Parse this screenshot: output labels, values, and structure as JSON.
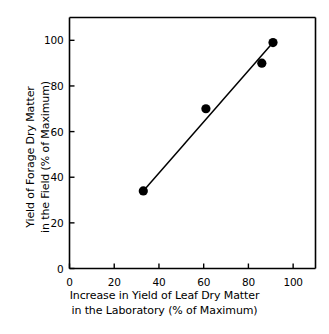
{
  "chart_data": {
    "type": "scatter",
    "title": "",
    "xlabel": "Increase in Yield of Leaf Dry Matter in the Laboratory (% of Maximum)",
    "ylabel": "Yield of Forage Dry Matter in the Field (% of Maximum)",
    "xlabel_line1": "Increase in Yield of Leaf Dry Matter",
    "xlabel_line2": "in the Laboratory (% of Maximum)",
    "ylabel_line1": "Yield of Forage Dry Matter",
    "ylabel_line2": "in the Field (% of Maximum)",
    "xlim": [
      0,
      110
    ],
    "ylim": [
      0,
      110
    ],
    "xticks": [
      0,
      20,
      40,
      60,
      80,
      100
    ],
    "yticks": [
      0,
      20,
      40,
      60,
      80,
      100
    ],
    "xtick_labels": [
      "0",
      "20",
      "40",
      "60",
      "80",
      "100"
    ],
    "ytick_labels": [
      "0",
      "20",
      "40",
      "60",
      "80",
      "100"
    ],
    "grid": false,
    "legend": false,
    "marker": "filled-circle",
    "marker_color": "#000000",
    "line_color": "#000000",
    "points": [
      {
        "x": 33,
        "y": 34
      },
      {
        "x": 61,
        "y": 70
      },
      {
        "x": 86,
        "y": 90
      },
      {
        "x": 91,
        "y": 99
      }
    ],
    "fit_line": {
      "label": "regression line",
      "x0": 33,
      "y0": 34,
      "x1": 91,
      "y1": 99
    }
  },
  "colors": {
    "axis": "#000000",
    "marker": "#000000",
    "line": "#000000",
    "background": "#ffffff"
  }
}
